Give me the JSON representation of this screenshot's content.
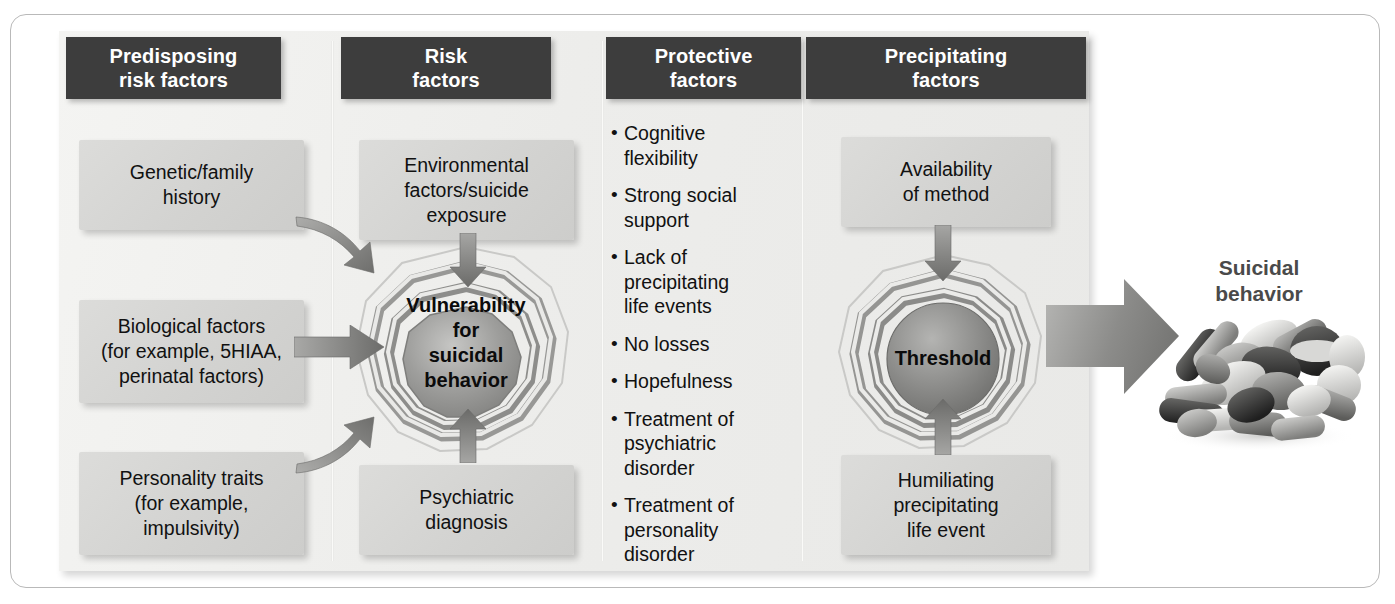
{
  "figure": {
    "columns": [
      {
        "id": "predisposing",
        "header": "Predisposing\nrisk factors",
        "header_line1": "Predisposing",
        "header_line2": "risk factors"
      },
      {
        "id": "risk",
        "header": "Risk\nfactors",
        "header_line1": "Risk",
        "header_line2": "factors"
      },
      {
        "id": "protective",
        "header": "Protective\nfactors",
        "header_line1": "Protective",
        "header_line2": "factors"
      },
      {
        "id": "precipitating",
        "header": "Precipitating\nfactors",
        "header_line1": "Precipitating",
        "header_line2": "factors"
      }
    ],
    "predisposing_boxes": [
      {
        "lines": [
          "Genetic/family",
          "history"
        ]
      },
      {
        "lines": [
          "Biological factors",
          "(for example, 5HIAA,",
          "perinatal factors)"
        ]
      },
      {
        "lines": [
          "Personality traits",
          "(for example,",
          "impulsivity)"
        ]
      }
    ],
    "risk_boxes": [
      {
        "lines": [
          "Environmental",
          "factors/suicide",
          "exposure"
        ]
      },
      {
        "lines": [
          "Psychiatric",
          "diagnosis"
        ]
      }
    ],
    "risk_center": {
      "lines": [
        "Vulnerability",
        "for",
        "suicidal",
        "behavior"
      ]
    },
    "protective_items": [
      {
        "bullet": "•",
        "lines": [
          "Cognitive",
          "flexibility"
        ]
      },
      {
        "bullet": "•",
        "lines": [
          "Strong social",
          "support"
        ]
      },
      {
        "bullet": "•",
        "lines": [
          "Lack of",
          "precipitating",
          "life events"
        ]
      },
      {
        "bullet": "•",
        "lines": [
          "No losses"
        ]
      },
      {
        "bullet": "•",
        "lines": [
          "Hopefulness"
        ]
      },
      {
        "bullet": "•",
        "lines": [
          "Treatment of",
          "psychiatric",
          "disorder"
        ]
      },
      {
        "bullet": "•",
        "lines": [
          "Treatment of",
          "personality",
          "disorder"
        ]
      }
    ],
    "precipitating_boxes": [
      {
        "lines": [
          "Availability",
          "of method"
        ]
      },
      {
        "lines": [
          "Humiliating",
          "precipitating",
          "life event"
        ]
      }
    ],
    "precipitating_center": {
      "lines": [
        "Threshold"
      ]
    },
    "outcome": {
      "lines": [
        "Suicidal",
        "behavior"
      ],
      "image": "pile-of-pills-photo"
    }
  },
  "colors": {
    "header_bar": "#3d3d3d",
    "header_text": "#ffffff",
    "box_fill": "#d5d5d3",
    "panel_bg": "#eeeeec",
    "body_text": "#111111",
    "outcome_text": "#4a4a4a",
    "arrow_gray": "#8d8d8d",
    "ring_dark": "#8e8e8e",
    "ring_light": "#efefed",
    "frame_border": "#b9b9b9"
  }
}
